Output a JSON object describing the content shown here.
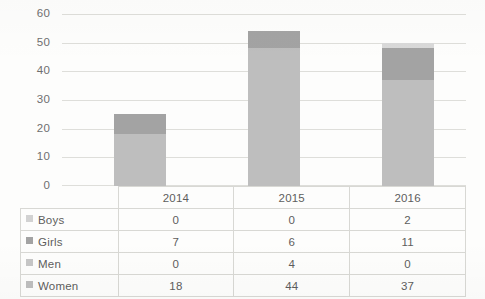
{
  "chart_data": {
    "type": "bar",
    "subtype": "stacked-column-with-data-table",
    "title": "",
    "xlabel": "",
    "ylabel": "",
    "categories": [
      "2014",
      "2015",
      "2016"
    ],
    "series": [
      {
        "name": "Boys",
        "values": [
          0,
          0,
          2
        ],
        "color": "#d2d2d2"
      },
      {
        "name": "Girls",
        "values": [
          7,
          6,
          11
        ],
        "color": "#a3a3a3"
      },
      {
        "name": "Men",
        "values": [
          0,
          4,
          0
        ],
        "color": "#c6c6c6"
      },
      {
        "name": "Women",
        "values": [
          18,
          44,
          37
        ],
        "color": "#bebebe"
      }
    ],
    "stack_order_bottom_to_top": [
      "Women",
      "Men",
      "Girls",
      "Boys"
    ],
    "totals": [
      25,
      54,
      50
    ],
    "ylim": [
      0,
      60
    ],
    "ytick_step": 10,
    "yticks": [
      "0",
      "10",
      "20",
      "30",
      "40",
      "50",
      "60"
    ],
    "grid": true,
    "legend_position": "data-table-row-labels"
  },
  "table": {
    "column_headers": [
      "",
      "2014",
      "2015",
      "2016"
    ],
    "rows": [
      {
        "label": "Boys",
        "swatch": "legend-swatch-boys",
        "cells": [
          "0",
          "0",
          "2"
        ]
      },
      {
        "label": "Girls",
        "swatch": "legend-swatch-girls",
        "cells": [
          "7",
          "6",
          "11"
        ]
      },
      {
        "label": "Men",
        "swatch": "legend-swatch-men",
        "cells": [
          "0",
          "4",
          "0"
        ]
      },
      {
        "label": "Women",
        "swatch": "legend-swatch-women",
        "cells": [
          "18",
          "44",
          "37"
        ]
      }
    ]
  },
  "axis": {
    "y_ticks": [
      {
        "value": "60"
      },
      {
        "value": "50"
      },
      {
        "value": "40"
      },
      {
        "value": "30"
      },
      {
        "value": "20"
      },
      {
        "value": "10"
      },
      {
        "value": "0"
      }
    ]
  },
  "colors": {
    "gridline": "#dededa",
    "tick_text": "#6f6f6f",
    "table_text": "#5d5d5d",
    "table_border": "#d8d8d4",
    "background": "#fdfdfc"
  }
}
